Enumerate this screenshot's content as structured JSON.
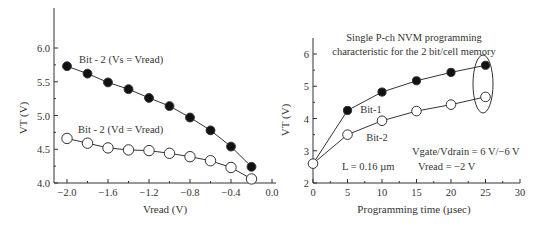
{
  "chart_data": [
    {
      "type": "line",
      "title": "",
      "xlabel": "Vread (V)",
      "ylabel": "VT (V)",
      "xlim": [
        -2.1,
        0.0
      ],
      "ylim": [
        4.0,
        6.5
      ],
      "xticks": [
        "-2.0",
        "-1.6",
        "-1.2",
        "-0.8",
        "-0.4",
        "0.0"
      ],
      "xtick_values": [
        -2.0,
        -1.6,
        -1.2,
        -0.8,
        -0.4,
        0.0
      ],
      "yticks": [
        "4.0",
        "4.5",
        "5.0",
        "5.5",
        "6.0"
      ],
      "ytick_values": [
        4.0,
        4.5,
        5.0,
        5.5,
        6.0
      ],
      "grid": false,
      "series": [
        {
          "name": "Bit - 2 (Vs = Vread)",
          "marker": "filled-circle",
          "x": [
            -2.0,
            -1.8,
            -1.6,
            -1.4,
            -1.2,
            -1.0,
            -0.8,
            -0.6,
            -0.4,
            -0.2
          ],
          "values": [
            5.73,
            5.62,
            5.49,
            5.39,
            5.26,
            5.14,
            4.97,
            4.78,
            4.54,
            4.24
          ]
        },
        {
          "name": "Bit - 2 (Vd = Vread)",
          "marker": "open-circle",
          "x": [
            -2.0,
            -1.8,
            -1.6,
            -1.4,
            -1.2,
            -1.0,
            -0.8,
            -0.6,
            -0.4,
            -0.2
          ],
          "values": [
            4.66,
            4.59,
            4.52,
            4.49,
            4.48,
            4.44,
            4.39,
            4.33,
            4.23,
            4.06
          ]
        }
      ]
    },
    {
      "type": "line",
      "title": "Single P-ch NVM programming characteristic for the 2 bit/cell memory",
      "title_lines": [
        "Single P-ch NVM programming",
        "characteristic for the 2 bit/cell memory"
      ],
      "xlabel": "Programming time (µsec)",
      "ylabel": "VT (V)",
      "xlim": [
        0,
        30
      ],
      "ylim": [
        2,
        6.5
      ],
      "xticks": [
        "0",
        "5",
        "10",
        "15",
        "20",
        "25",
        "30"
      ],
      "xtick_values": [
        0,
        5,
        10,
        15,
        20,
        25,
        30
      ],
      "yticks": [
        "2",
        "3",
        "4",
        "5",
        "6"
      ],
      "ytick_values": [
        2,
        3,
        4,
        5,
        6
      ],
      "grid": false,
      "annotations": [
        "Vgate/Vdrain = 6 V/−6 V",
        "Vread = −2 V",
        "L = 0.16 µm",
        "ellipse around t = 25 µsec points"
      ],
      "series": [
        {
          "name": "Bit-1",
          "marker": "filled-circle",
          "x": [
            0,
            5,
            10,
            15,
            20,
            25
          ],
          "values": [
            2.6,
            4.25,
            4.82,
            5.17,
            5.43,
            5.65
          ]
        },
        {
          "name": "Bit-2",
          "marker": "open-circle",
          "x": [
            0,
            5,
            10,
            15,
            20,
            25
          ],
          "values": [
            2.6,
            3.5,
            3.93,
            4.23,
            4.43,
            4.67
          ]
        }
      ]
    }
  ],
  "left": {
    "ylabel": "VT (V)",
    "xlabel": "Vread (V)",
    "label_filled": "Bit - 2 (Vs = Vread)",
    "label_open": "Bit - 2 (Vd = Vread)"
  },
  "right": {
    "title_line1": "Single P-ch NVM programming",
    "title_line2": "characteristic for the 2 bit/cell memory",
    "ylabel": "VT (V)",
    "xlabel": "Programming time (µsec)",
    "label_bit1": "Bit-1",
    "label_bit2": "Bit-2",
    "annot_vgate": "Vgate/Vdrain = 6 V/−6 V",
    "annot_vread": "Vread = −2 V",
    "annot_L": "L = 0.16 µm"
  }
}
